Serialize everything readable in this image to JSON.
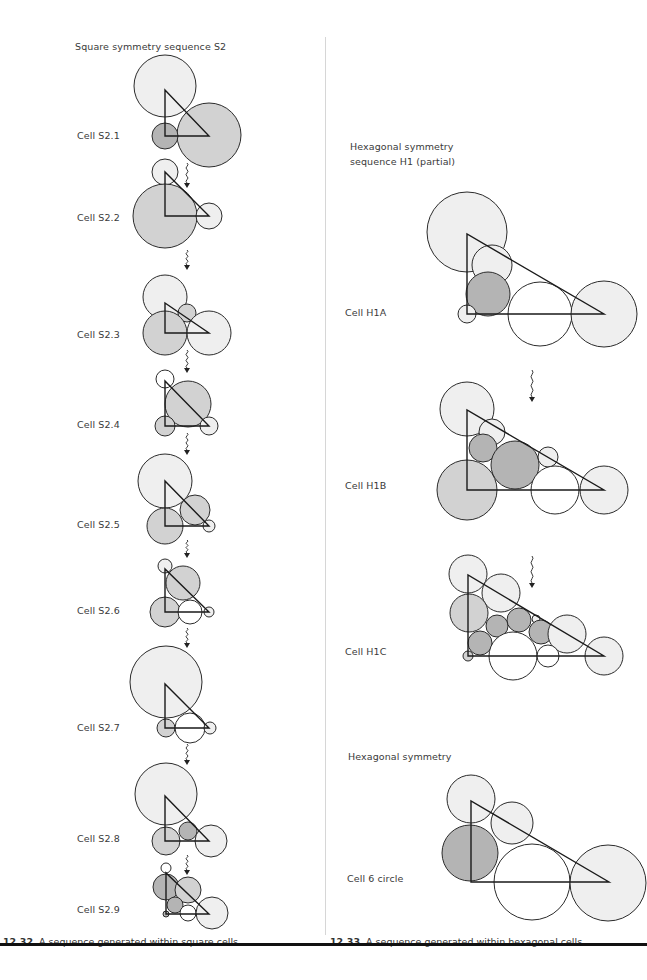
{
  "colors": {
    "stroke": "#2b2b2b",
    "white": "#ffffff",
    "light": "#efefef",
    "mid": "#d2d2d2",
    "dark": "#b4b4b4",
    "divider": "#d6d6d6",
    "rule": "#111111"
  },
  "left_panel": {
    "title": "Square symmetry sequence S2",
    "caption_num": "12.32",
    "caption_text": "A sequence generated within square cells",
    "cells": [
      {
        "label": "Cell S2.1",
        "label_y": 135
      },
      {
        "label": "Cell S2.2",
        "label_y": 217
      },
      {
        "label": "Cell S2.3",
        "label_y": 334
      },
      {
        "label": "Cell S2.4",
        "label_y": 424
      },
      {
        "label": "Cell S2.5",
        "label_y": 524
      },
      {
        "label": "Cell S2.6",
        "label_y": 610
      },
      {
        "label": "Cell S2.7",
        "label_y": 727
      },
      {
        "label": "Cell S2.8",
        "label_y": 838
      },
      {
        "label": "Cell S2.9",
        "label_y": 909
      }
    ]
  },
  "right_panel": {
    "title_line1": "Hexagonal symmetry",
    "title_line2": "sequence H1 (partial)",
    "section2_title": "Hexagonal symmetry",
    "caption_num": "12.33",
    "caption_text": "A sequence generated within hexagonal cells",
    "cells": [
      {
        "label": "Cell H1A",
        "label_y": 312
      },
      {
        "label": "Cell H1B",
        "label_y": 485
      },
      {
        "label": "Cell H1C",
        "label_y": 651
      },
      {
        "label": "Cell 6 circle",
        "label_y": 878
      }
    ]
  },
  "diagrams": [
    {
      "name": "cell-s2-1",
      "tri": [
        165,
        90,
        165,
        136,
        209,
        136
      ],
      "circles": [
        [
          165,
          86,
          31,
          "light"
        ],
        [
          209,
          135,
          32,
          "mid"
        ],
        [
          165,
          136,
          13,
          "dark"
        ]
      ]
    },
    {
      "name": "cell-s2-2",
      "tri": [
        165,
        172,
        165,
        216,
        209,
        216
      ],
      "circles": [
        [
          165,
          172,
          13,
          "light"
        ],
        [
          165,
          216,
          32,
          "mid"
        ],
        [
          209,
          216,
          13,
          "light"
        ]
      ]
    },
    {
      "name": "cell-s2-3",
      "tri": [
        165,
        303,
        165,
        333,
        209,
        333
      ],
      "circles": [
        [
          165,
          297,
          22,
          "light"
        ],
        [
          187,
          313,
          9,
          "mid"
        ],
        [
          165,
          333,
          22,
          "mid"
        ],
        [
          209,
          333,
          22,
          "light"
        ]
      ]
    },
    {
      "name": "cell-s2-4",
      "tri": [
        165,
        381,
        165,
        426,
        209,
        426
      ],
      "circles": [
        [
          165,
          379,
          9,
          "white"
        ],
        [
          188,
          404,
          23,
          "mid"
        ],
        [
          165,
          426,
          10,
          "mid"
        ],
        [
          209,
          426,
          9,
          "light"
        ]
      ]
    },
    {
      "name": "cell-s2-5",
      "tri": [
        165,
        481,
        165,
        526,
        209,
        526
      ],
      "circles": [
        [
          165,
          481,
          27,
          "light"
        ],
        [
          195,
          510,
          15,
          "mid"
        ],
        [
          165,
          526,
          18,
          "mid"
        ],
        [
          209,
          526,
          6,
          "light"
        ]
      ]
    },
    {
      "name": "cell-s2-6",
      "tri": [
        165,
        569,
        165,
        612,
        209,
        612
      ],
      "circles": [
        [
          165,
          566,
          7,
          "light"
        ],
        [
          183,
          583,
          17,
          "mid"
        ],
        [
          165,
          612,
          15,
          "mid"
        ],
        [
          190,
          612,
          12,
          "white"
        ],
        [
          209,
          612,
          5,
          "light"
        ]
      ]
    },
    {
      "name": "cell-s2-7",
      "tri": [
        165,
        684,
        165,
        728,
        209,
        728
      ],
      "circles": [
        [
          166,
          682,
          36,
          "light"
        ],
        [
          166,
          728,
          9,
          "mid"
        ],
        [
          190,
          728,
          15,
          "white"
        ],
        [
          210,
          728,
          6,
          "light"
        ]
      ]
    },
    {
      "name": "cell-s2-8",
      "tri": [
        165,
        796,
        165,
        841,
        209,
        841
      ],
      "circles": [
        [
          166,
          794,
          31,
          "light"
        ],
        [
          188,
          831,
          9,
          "dark"
        ],
        [
          166,
          841,
          14,
          "mid"
        ],
        [
          211,
          841,
          16,
          "light"
        ]
      ]
    },
    {
      "name": "cell-s2-9",
      "tri": [
        166,
        873,
        166,
        914,
        209,
        914
      ],
      "circles": [
        [
          166,
          868,
          5,
          "white"
        ],
        [
          166,
          887,
          13,
          "dark"
        ],
        [
          188,
          890,
          13,
          "mid"
        ],
        [
          175,
          905,
          8,
          "dark"
        ],
        [
          188,
          913,
          8,
          "white"
        ],
        [
          166,
          914,
          3,
          "dark"
        ],
        [
          212,
          913,
          16,
          "light"
        ]
      ]
    },
    {
      "name": "cell-h1a",
      "tri": [
        467,
        234,
        467,
        314,
        604,
        314
      ],
      "circles": [
        [
          467,
          232,
          40,
          "light"
        ],
        [
          492,
          265,
          20,
          "light"
        ],
        [
          488,
          294,
          22,
          "dark"
        ],
        [
          467,
          314,
          9,
          "light"
        ],
        [
          540,
          314,
          32,
          "white"
        ],
        [
          604,
          314,
          33,
          "light"
        ]
      ]
    },
    {
      "name": "cell-h1b",
      "tri": [
        467,
        410,
        467,
        490,
        604,
        490
      ],
      "circles": [
        [
          467,
          409,
          27,
          "light"
        ],
        [
          492,
          432,
          13,
          "light"
        ],
        [
          483,
          448,
          14,
          "dark"
        ],
        [
          515,
          465,
          24,
          "dark"
        ],
        [
          548,
          457,
          10,
          "light"
        ],
        [
          467,
          490,
          30,
          "mid"
        ],
        [
          555,
          490,
          24,
          "white"
        ],
        [
          604,
          490,
          24,
          "light"
        ]
      ]
    },
    {
      "name": "cell-h1c",
      "tri": [
        468,
        575,
        468,
        656,
        604,
        656
      ],
      "circles": [
        [
          468,
          574,
          19,
          "light"
        ],
        [
          501,
          593,
          19,
          "light"
        ],
        [
          469,
          613,
          19,
          "mid"
        ],
        [
          497,
          626,
          11,
          "dark"
        ],
        [
          519,
          620,
          12,
          "dark"
        ],
        [
          536,
          619,
          4,
          "light"
        ],
        [
          541,
          632,
          12,
          "dark"
        ],
        [
          480,
          643,
          12,
          "dark"
        ],
        [
          567,
          634,
          19,
          "light"
        ],
        [
          468,
          656,
          5,
          "mid"
        ],
        [
          513,
          656,
          24,
          "white"
        ],
        [
          548,
          656,
          11,
          "white"
        ],
        [
          604,
          656,
          19,
          "light"
        ]
      ]
    },
    {
      "name": "cell-6-circle",
      "tri": [
        471,
        801,
        471,
        882,
        609,
        882
      ],
      "circles": [
        [
          471,
          799,
          24,
          "light"
        ],
        [
          512,
          823,
          21,
          "light"
        ],
        [
          470,
          853,
          28,
          "dark"
        ],
        [
          532,
          882,
          38,
          "white"
        ],
        [
          608,
          883,
          38,
          "light"
        ]
      ]
    }
  ],
  "arrows": [
    {
      "name": "arrow-s2-1",
      "x": 187,
      "y1": 163,
      "y2": 188
    },
    {
      "name": "arrow-s2-2",
      "x": 187,
      "y1": 250,
      "y2": 270
    },
    {
      "name": "arrow-s2-3",
      "x": 187,
      "y1": 350,
      "y2": 373
    },
    {
      "name": "arrow-s2-4",
      "x": 187,
      "y1": 433,
      "y2": 455
    },
    {
      "name": "arrow-s2-5",
      "x": 187,
      "y1": 540,
      "y2": 558
    },
    {
      "name": "arrow-s2-6",
      "x": 187,
      "y1": 628,
      "y2": 648
    },
    {
      "name": "arrow-s2-7",
      "x": 187,
      "y1": 744,
      "y2": 765
    },
    {
      "name": "arrow-s2-8",
      "x": 187,
      "y1": 855,
      "y2": 875
    },
    {
      "name": "arrow-h1-1",
      "x": 532,
      "y1": 370,
      "y2": 402
    },
    {
      "name": "arrow-h1-2",
      "x": 532,
      "y1": 556,
      "y2": 588
    }
  ]
}
